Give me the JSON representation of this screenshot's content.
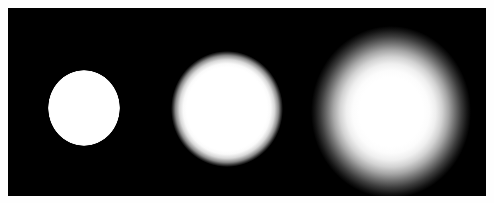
{
  "image": {
    "kind": "grayscale-photograph",
    "subject": "three white discs on a black background with increasing blur",
    "width": 494,
    "height": 203
  },
  "panel": {
    "background_color": "#000000",
    "border_color": "#ffffff",
    "x": 8,
    "y": 8,
    "width": 478,
    "height": 188
  },
  "page": {
    "background_color": "#fefefe"
  },
  "discs": [
    {
      "name": "sharp-disc",
      "order": 1,
      "fill_color": "#ffffff",
      "center_x": 76,
      "center_y": 100,
      "radius_x": 36,
      "radius_y": 38,
      "edge": "sharp",
      "blur_px": 1,
      "peak_brightness": 255
    },
    {
      "name": "medium-blur-disc",
      "order": 2,
      "fill_color": "#ffffff",
      "center_x": 219,
      "center_y": 101,
      "radius_x": 56,
      "radius_y": 58,
      "edge": "soft",
      "blur_px": 8,
      "peak_brightness": 255
    },
    {
      "name": "heavy-blur-disc",
      "order": 3,
      "fill_color": "#ffffff",
      "center_x": 383,
      "center_y": 104,
      "radius_x": 80,
      "radius_y": 86,
      "edge": "very-soft-glow",
      "blur_px": 34,
      "peak_brightness": 255
    }
  ]
}
